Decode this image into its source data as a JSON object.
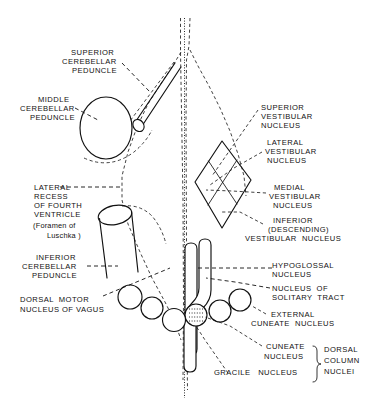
{
  "figure": {
    "ink_color": "#111111",
    "background_color": "#ffffff"
  },
  "labels": {
    "superior_cerebellar_peduncle": {
      "line1": "SUPERIOR",
      "line2": "CEREBELLAR",
      "line3": "PEDUNCLE"
    },
    "middle_cerebellar_peduncle": {
      "line1": "MIDDLE",
      "line2": "CEREBELLAR",
      "line3": "PEDUNCLE"
    },
    "lateral_recess": {
      "line1": "LATERAL",
      "line2": "RECESS",
      "line3": "OF FOURTH",
      "line4": "VENTRICLE",
      "line5": "(Foramen of",
      "line6": "Luschka )"
    },
    "inferior_cerebellar_peduncle": {
      "line1": "INFERIOR",
      "line2": "CEREBELLAR",
      "line3": "PEDUNCLE"
    },
    "dorsal_motor_nucleus_of_vagus": {
      "line1": "DORSAL  MOTOR",
      "line2": "NUCLEUS OF VAGUS"
    },
    "superior_vestibular_nucleus": {
      "line1": "SUPERIOR",
      "line2": "VESTIBULAR",
      "line3": "NUCLEUS"
    },
    "lateral_vestibular_nucleus": {
      "line1": "LATERAL",
      "line2": "VESTIBULAR",
      "line3": "NUCLEUS"
    },
    "medial_vestibular_nucleus": {
      "line1": "MEDIAL",
      "line2": "VESTIBULAR",
      "line3": "NUCLEUS"
    },
    "inferior_vestibular_nucleus": {
      "line1": "INFERIOR",
      "line2": "(DESCENDING)",
      "line3": "VESTIBULAR  NUCLEUS"
    },
    "hypoglossal_nucleus": {
      "line1": "HYPOGLOSSAL",
      "line2": "NUCLEUS"
    },
    "nucleus_of_solitary_tract": {
      "line1": "NUCLEUS  OF",
      "line2": "SOLITARY  TRACT"
    },
    "external_cuneate_nucleus": {
      "line1": "EXTERNAL",
      "line2": "CUNEATE  NUCLEUS"
    },
    "cuneate_nucleus": {
      "line1": "CUNEATE",
      "line2": "NUCLEUS"
    },
    "gracile_nucleus": {
      "line1": "GRACILE   NUCLEUS"
    },
    "dorsal_column_nuclei": {
      "line1": "DORSAL",
      "line2": "COLUMN",
      "line3": "NUCLEI"
    }
  }
}
